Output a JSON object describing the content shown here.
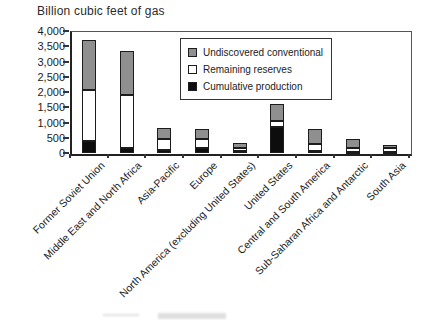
{
  "title": "Billion cubic feet of gas",
  "legend": {
    "items": [
      {
        "label": "Undiscovered conventional",
        "color": "#8f8f8f"
      },
      {
        "label": "Remaining reserves",
        "color": "#ffffff"
      },
      {
        "label": "Cumulative production",
        "color": "#0d0d0d"
      }
    ]
  },
  "chart_data": {
    "type": "bar",
    "stacked": true,
    "title": "Billion cubic feet of gas",
    "categories": [
      "Former Soviet Union",
      "Middle East and North Africa",
      "Asia-Pacific",
      "Europe",
      "North America (excluding United States)",
      "United States",
      "Central and South America",
      "Sub-Saharan Africa and Antarctic",
      "South Asia"
    ],
    "series": [
      {
        "name": "Cumulative production",
        "color": "#0d0d0d",
        "values": [
          400,
          150,
          100,
          150,
          50,
          850,
          80,
          25,
          20
        ]
      },
      {
        "name": "Remaining reserves",
        "color": "#ffffff",
        "values": [
          1650,
          1750,
          350,
          300,
          125,
          200,
          220,
          150,
          150
        ]
      },
      {
        "name": "Undiscovered conventional",
        "color": "#8f8f8f",
        "values": [
          1650,
          1450,
          375,
          350,
          150,
          550,
          500,
          275,
          80
        ]
      }
    ],
    "totals": [
      3700,
      3350,
      825,
      800,
      325,
      1600,
      800,
      450,
      250
    ],
    "ylabel": "Billion cubic feet of gas",
    "ylim": [
      0,
      4000
    ],
    "ytick_step": 500,
    "yticks": [
      "0",
      "500",
      "1,000",
      "1,500",
      "2,000",
      "2,500",
      "3,000",
      "3,500",
      "4,000"
    ],
    "grid": false,
    "legend_position": "inside-top-right"
  }
}
